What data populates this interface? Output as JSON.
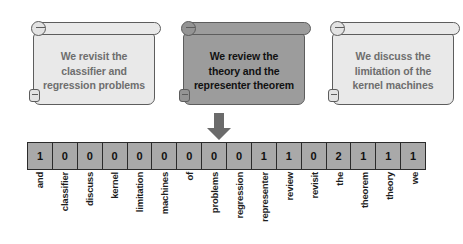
{
  "diagram": {
    "arrow": {
      "name": "down-arrow",
      "color": "#6b6b6b",
      "direction": "down"
    },
    "cards": [
      {
        "id": "card-revisit",
        "text": "We revisit the\nclassifier and\nregression problems",
        "highlighted": false,
        "fill": "#e9e9e9",
        "text_color": "#6e6e6e"
      },
      {
        "id": "card-review",
        "text": "We review the\ntheory and the\nrepresenter theorem",
        "highlighted": true,
        "fill": "#9c9c9c",
        "text_color": "#111111"
      },
      {
        "id": "card-discuss",
        "text": "We discuss the\nlimitation of the\nkernel machines",
        "highlighted": false,
        "fill": "#e9e9e9",
        "text_color": "#6e6e6e"
      }
    ],
    "vector": {
      "cell_fill": "#a9a9a9",
      "border_color": "#2b2b2b",
      "counts": [
        1,
        0,
        0,
        0,
        0,
        0,
        0,
        0,
        0,
        1,
        1,
        0,
        2,
        1,
        1,
        1
      ],
      "labels": [
        "and",
        "classifier",
        "discuss",
        "kernel",
        "limitation",
        "machines",
        "of",
        "problems",
        "regression",
        "representer",
        "review",
        "revisit",
        "the",
        "theorem",
        "theory",
        "we"
      ]
    }
  },
  "chart_data": {
    "type": "bar",
    "xlabel": "vocabulary term",
    "ylabel": "count",
    "categories": [
      "and",
      "classifier",
      "discuss",
      "kernel",
      "limitation",
      "machines",
      "of",
      "problems",
      "regression",
      "representer",
      "review",
      "revisit",
      "the",
      "theorem",
      "theory",
      "we"
    ],
    "values": [
      1,
      0,
      0,
      0,
      0,
      0,
      0,
      0,
      0,
      1,
      1,
      0,
      2,
      1,
      1,
      1
    ],
    "ylim": [
      0,
      2
    ],
    "grid": false,
    "legend": "none"
  }
}
